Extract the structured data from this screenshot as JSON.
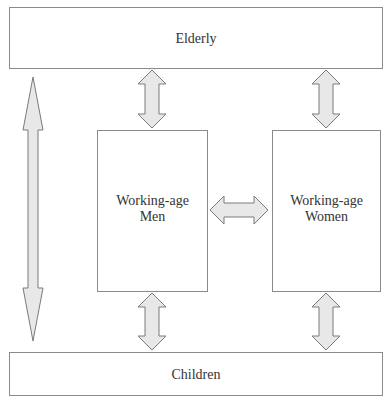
{
  "diagram": {
    "nodes": {
      "elderly": {
        "label": "Elderly"
      },
      "men": {
        "label_lines": [
          "Working-age",
          "Men"
        ]
      },
      "women": {
        "label_lines": [
          "Working-age",
          "Women"
        ]
      },
      "children": {
        "label": "Children"
      }
    },
    "edges": [
      {
        "from": "elderly",
        "to": "men",
        "type": "bidirectional"
      },
      {
        "from": "elderly",
        "to": "women",
        "type": "bidirectional"
      },
      {
        "from": "men",
        "to": "women",
        "type": "bidirectional"
      },
      {
        "from": "men",
        "to": "children",
        "type": "bidirectional"
      },
      {
        "from": "women",
        "to": "children",
        "type": "bidirectional"
      },
      {
        "from": "elderly",
        "to": "children",
        "type": "bidirectional"
      }
    ],
    "colors": {
      "box_stroke": "#8a8a8a",
      "arrow_fill": "#e8e8e8",
      "arrow_stroke": "#7a7a7a",
      "text": "#333333"
    }
  }
}
